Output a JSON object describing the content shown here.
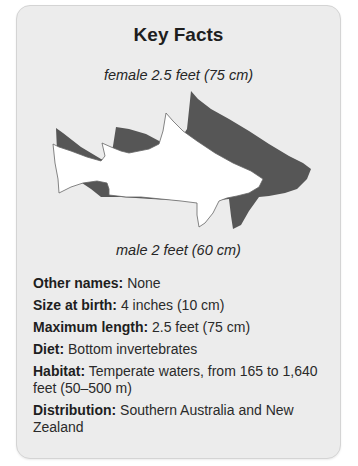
{
  "card": {
    "title": "Key Facts",
    "illustration": {
      "top_caption": "female 2.5 feet (75 cm)",
      "bottom_caption": "male 2 feet (60 cm)",
      "female_color": "#555555",
      "male_color": "#ffffff",
      "icons": [
        "female-shark-silhouette-icon",
        "male-shark-silhouette-icon"
      ]
    },
    "facts": [
      {
        "label": "Other names:",
        "value": "None"
      },
      {
        "label": "Size at birth:",
        "value": "4 inches (10 cm)"
      },
      {
        "label": "Maximum length:",
        "value": "2.5 feet (75 cm)"
      },
      {
        "label": "Diet:",
        "value": "Bottom invertebrates"
      },
      {
        "label": "Habitat:",
        "value": "Temperate waters, from 165 to 1,640 feet (50–500 m)"
      },
      {
        "label": "Distribution:",
        "value": "Southern Australia and New Zealand"
      }
    ]
  },
  "colors": {
    "card_background": "#ececec",
    "card_border": "#d4d4d4",
    "text": "#222222"
  }
}
